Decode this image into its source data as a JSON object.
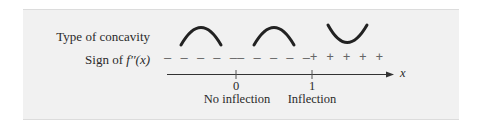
{
  "diagram": {
    "rows": [
      {
        "label": "Type of concavity"
      },
      {
        "label_prefix": "Sign of ",
        "label_func": "f′′(x)"
      }
    ],
    "columns": [
      {
        "concavity": "down",
        "sign": "– – – – –"
      },
      {
        "concavity": "down",
        "sign": "– – – – –"
      },
      {
        "concavity": "up",
        "sign": "+ + + + +"
      }
    ],
    "axis": {
      "variable": "x",
      "ticks": [
        {
          "value": "0",
          "annotation": "No inflection"
        },
        {
          "value": "1",
          "annotation": "Inflection"
        }
      ]
    }
  }
}
